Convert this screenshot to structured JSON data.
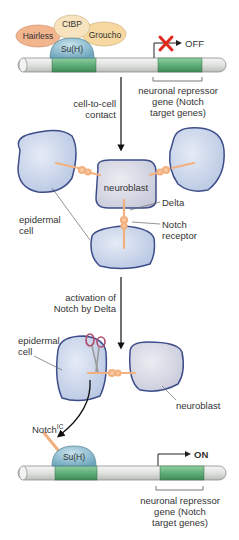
{
  "diagram": {
    "colors": {
      "dna_rod": "#e6e8e6",
      "gene_segment": "#5fae78",
      "cell_fill": "#c9d6ea",
      "cell_border": "#3d4d8a",
      "neuroblast_fill": "#dcdde6",
      "protein_orange": "#f3b07f",
      "suh_fill": "#8fbfd0",
      "hairless_fill": "#f2b58e",
      "ctbp_fill": "#f7deb0",
      "groucho_fill": "#f6d8a0",
      "off_x": "#e0281c",
      "arrow": "#111111"
    },
    "top_panel": {
      "proteins": {
        "hairless": "Hairless",
        "ctbp": "CtBP",
        "groucho": "Groucho",
        "suh": "Su(H)"
      },
      "state": "OFF",
      "gene_label": [
        "neuronal repressor",
        "gene (Notch",
        "target genes)"
      ]
    },
    "step1_label": [
      "cell-to-cell",
      "contact"
    ],
    "middle_panel": {
      "neuroblast": "neuroblast",
      "delta": "Delta",
      "notch_receptor": [
        "Notch",
        "receptor"
      ],
      "epidermal_cell": [
        "epidermal",
        "cell"
      ]
    },
    "step2_label": [
      "activation of",
      "Notch by Delta"
    ],
    "lower_panel": {
      "epidermal_cell": [
        "epidermal",
        "cell"
      ],
      "neuroblast": "neuroblast",
      "notch_ic": "Notch",
      "notch_ic_sup": "IC"
    },
    "bottom_panel": {
      "suh": "Su(H)",
      "state": "ON",
      "gene_label": [
        "neuronal repressor",
        "gene (Notch",
        "target genes)"
      ]
    }
  }
}
